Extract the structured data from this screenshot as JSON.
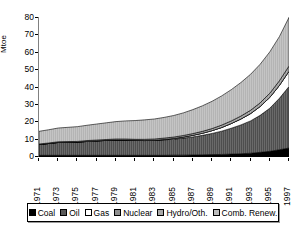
{
  "axes": {
    "ylabel": "Mtoe",
    "yticks": [
      "80",
      "70",
      "60",
      "50",
      "40",
      "30",
      "20",
      "10",
      "0"
    ],
    "xticks": [
      "1971",
      "1973",
      "1975",
      "1977",
      "1979",
      "1981",
      "1983",
      "1985",
      "1987",
      "1989",
      "1991",
      "1993",
      "1995",
      "1997"
    ]
  },
  "legend": {
    "items": [
      {
        "label": "Coal",
        "swatch": "solid-black-swatch",
        "color": "#000000"
      },
      {
        "label": "Oil",
        "swatch": "dark-gray-hatch-swatch",
        "color": "#595959"
      },
      {
        "label": "Gas",
        "swatch": "white-swatch",
        "color": "#ffffff"
      },
      {
        "label": "Nuclear",
        "swatch": "mid-gray-swatch",
        "color": "#8f8f8f"
      },
      {
        "label": "Hydro/Oth.",
        "swatch": "light-gray-swatch",
        "color": "#a8a8a8"
      },
      {
        "label": "Comb. Renew.",
        "swatch": "pale-gray-swatch",
        "color": "#bdbdbd"
      }
    ]
  },
  "chart_data": {
    "type": "area",
    "title": "",
    "subtitle": "",
    "xlabel": "",
    "ylabel": "Mtoe",
    "xlim": [
      1971,
      1997
    ],
    "ylim": [
      0,
      80
    ],
    "yticks": [
      0,
      10,
      20,
      30,
      40,
      50,
      60,
      70,
      80
    ],
    "grid": false,
    "legend_position": "bottom",
    "stacked": true,
    "x": [
      1971,
      1972,
      1973,
      1974,
      1975,
      1976,
      1977,
      1978,
      1979,
      1980,
      1981,
      1982,
      1983,
      1984,
      1985,
      1986,
      1987,
      1988,
      1989,
      1990,
      1991,
      1992,
      1993,
      1994,
      1995,
      1996,
      1997
    ],
    "series": [
      {
        "name": "Coal",
        "color": "#000000",
        "values": [
          0.4,
          0.4,
          0.4,
          0.4,
          0.4,
          0.4,
          0.4,
          0.4,
          0.4,
          0.4,
          0.4,
          0.4,
          0.4,
          0.4,
          0.5,
          0.5,
          0.6,
          0.7,
          0.8,
          0.9,
          1.1,
          1.3,
          1.6,
          2.1,
          2.7,
          3.6,
          4.6
        ]
      },
      {
        "name": "Oil",
        "color": "#595959",
        "values": [
          6.2,
          6.8,
          7.4,
          7.5,
          7.6,
          8.0,
          8.3,
          8.6,
          8.8,
          8.8,
          8.6,
          8.5,
          8.6,
          8.9,
          9.2,
          9.8,
          10.4,
          11.2,
          12.2,
          13.4,
          14.9,
          16.6,
          18.6,
          21.3,
          24.8,
          29.6,
          35.4
        ]
      },
      {
        "name": "Gas",
        "color": "#ffffff",
        "values": [
          0.0,
          0.0,
          0.0,
          0.0,
          0.0,
          0.0,
          0.0,
          0.0,
          0.0,
          0.0,
          0.0,
          0.0,
          0.1,
          0.2,
          0.4,
          0.6,
          0.9,
          1.2,
          1.6,
          2.1,
          2.7,
          3.4,
          4.2,
          5.1,
          6.2,
          7.4,
          8.8
        ]
      },
      {
        "name": "Nuclear",
        "color": "#8f8f8f",
        "values": [
          0.0,
          0.0,
          0.0,
          0.0,
          0.0,
          0.0,
          0.0,
          0.0,
          0.0,
          0.0,
          0.0,
          0.0,
          0.0,
          0.0,
          0.0,
          0.0,
          0.0,
          0.0,
          0.0,
          0.0,
          0.0,
          0.0,
          0.0,
          0.0,
          0.0,
          0.0,
          0.0
        ]
      },
      {
        "name": "Hydro/Oth.",
        "color": "#a8a8a8",
        "values": [
          0.3,
          0.3,
          0.4,
          0.4,
          0.4,
          0.5,
          0.5,
          0.5,
          0.6,
          0.6,
          0.6,
          0.7,
          0.7,
          0.8,
          0.8,
          0.9,
          1.0,
          1.1,
          1.2,
          1.4,
          1.5,
          1.7,
          1.9,
          2.1,
          2.4,
          2.7,
          3.0
        ]
      },
      {
        "name": "Comb. Renew.",
        "color": "#bdbdbd",
        "values": [
          7.3,
          7.6,
          7.9,
          8.2,
          8.5,
          8.8,
          9.2,
          9.6,
          10.0,
          10.4,
          10.8,
          11.2,
          11.5,
          11.9,
          12.4,
          13.0,
          13.8,
          14.7,
          15.7,
          16.8,
          18.0,
          19.3,
          20.7,
          22.2,
          23.8,
          25.4,
          28.0
        ]
      }
    ]
  }
}
